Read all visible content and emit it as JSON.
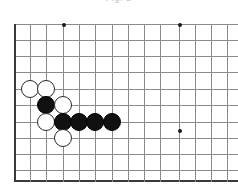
{
  "caption": {
    "text": "Fig. 2"
  },
  "board": {
    "title": "go-board-diagram",
    "colors": {
      "grid_line": "#8a8a8a",
      "edge_line": "#3a3a3a",
      "star_point": "#1a1a1a",
      "black_stone": "#111111",
      "white_stone": "#ffffff",
      "stone_outline": "#2a2a2a",
      "background": "#ffffff"
    },
    "geometry": {
      "origin_x": 14,
      "origin_y": 24,
      "spacing": 16.2,
      "columns": 14,
      "rows": 10,
      "left_edge_is_border": true,
      "bottom_edge_is_border": true,
      "right_edge_is_border": false,
      "top_edge_is_border": false,
      "stone_diameter": 18
    },
    "vertical_lines_x": [
      14,
      30,
      46,
      63,
      79,
      95,
      112,
      128,
      144,
      160,
      179,
      195,
      211,
      227
    ],
    "horizontal_lines_y": [
      24,
      40,
      56,
      72,
      89,
      105,
      122,
      138,
      154,
      170,
      180
    ],
    "bottom_border_y": 180,
    "star_points": [
      {
        "name": "star-point-upper-left",
        "col": 3,
        "row": 0,
        "x": 63,
        "y": 24
      },
      {
        "name": "star-point-upper-right",
        "col": 10,
        "row": 0,
        "x": 179,
        "y": 24
      },
      {
        "name": "star-point-lower-right",
        "col": 10,
        "row": 6.5,
        "x": 179,
        "y": 130
      }
    ],
    "stones": [
      {
        "id": 1,
        "color": "white",
        "col": 1,
        "row": 4,
        "x": 30,
        "y": 89,
        "label": "white-stone-b4"
      },
      {
        "id": 2,
        "color": "white",
        "col": 2,
        "row": 4,
        "x": 46,
        "y": 89,
        "label": "white-stone-c4"
      },
      {
        "id": 3,
        "color": "black",
        "col": 2,
        "row": 5,
        "x": 46,
        "y": 105,
        "label": "black-stone-c5"
      },
      {
        "id": 4,
        "color": "white",
        "col": 3,
        "row": 5,
        "x": 63,
        "y": 105,
        "label": "white-stone-d5"
      },
      {
        "id": 5,
        "color": "white",
        "col": 2,
        "row": 6,
        "x": 46,
        "y": 122,
        "label": "white-stone-c6"
      },
      {
        "id": 6,
        "color": "black",
        "col": 3,
        "row": 6,
        "x": 63,
        "y": 122,
        "label": "black-stone-d6"
      },
      {
        "id": 7,
        "color": "black",
        "col": 4,
        "row": 6,
        "x": 79,
        "y": 122,
        "label": "black-stone-e6"
      },
      {
        "id": 8,
        "color": "black",
        "col": 5,
        "row": 6,
        "x": 95,
        "y": 122,
        "label": "black-stone-f6"
      },
      {
        "id": 9,
        "color": "black",
        "col": 6,
        "row": 6,
        "x": 112,
        "y": 122,
        "label": "black-stone-g6"
      },
      {
        "id": 10,
        "color": "white",
        "col": 3,
        "row": 7,
        "x": 63,
        "y": 138,
        "label": "white-stone-d7"
      }
    ],
    "counts": {
      "black_stones": 5,
      "white_stones": 5,
      "total_stones": 10
    }
  }
}
